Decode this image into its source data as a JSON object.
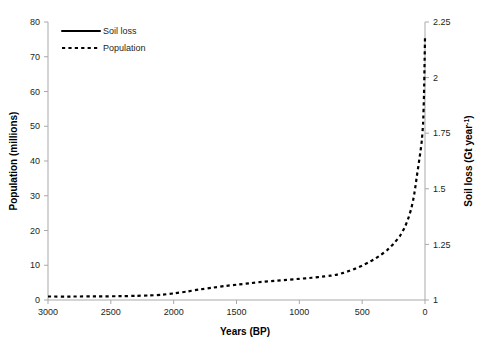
{
  "chart_data": {
    "type": "line",
    "title": "",
    "xlabel": "Years (BP)",
    "ylabel": "Population (millions)",
    "y2label": "Soil loss (Gt year-1)",
    "y2label_base": "Soil loss (Gt year",
    "y2label_sup": "-1",
    "y2label_tail": ")",
    "grid": false,
    "legend_position": "top-left",
    "x_reversed": true,
    "xlim": [
      0,
      3000
    ],
    "ylim": [
      0,
      80
    ],
    "y2lim": [
      1,
      2.25
    ],
    "xticks": [
      3000,
      2500,
      2000,
      1500,
      1000,
      500,
      0
    ],
    "xtick_labels": [
      "3000",
      "2500",
      "2000",
      "1500",
      "1000",
      "500",
      "0"
    ],
    "yticks": [
      0,
      10,
      20,
      30,
      40,
      50,
      60,
      70,
      80
    ],
    "ytick_labels": [
      "0",
      "10",
      "20",
      "30",
      "40",
      "50",
      "60",
      "70",
      "80"
    ],
    "y2ticks": [
      1,
      1.25,
      1.5,
      1.75,
      2,
      2.25
    ],
    "y2tick_labels": [
      "1",
      "1.25",
      "1.5",
      "1.75",
      "2",
      "2.25"
    ],
    "series": [
      {
        "name": "Soil loss",
        "style": "solid",
        "axis": "right",
        "x": [
          3000,
          2800,
          2600,
          2400,
          2300,
          2200,
          2150,
          2100,
          2000,
          1900,
          1800,
          1700,
          1600,
          1500,
          1400,
          1300,
          1200,
          1100,
          1000,
          900,
          800,
          750,
          700,
          650,
          600,
          550,
          500,
          450,
          400,
          350,
          300,
          250,
          200,
          160,
          130,
          110,
          95,
          85,
          75,
          65,
          55,
          45,
          35,
          25,
          15,
          8,
          3,
          0
        ],
        "values": [
          6.4,
          6.4,
          6.45,
          6.5,
          6.6,
          6.8,
          7.0,
          7.4,
          8.4,
          9.3,
          10.0,
          10.5,
          10.8,
          11.1,
          11.3,
          11.5,
          11.7,
          11.9,
          12.1,
          12.3,
          12.6,
          12.8,
          13.0,
          13.6,
          14.3,
          15.1,
          16.0,
          17.0,
          18.1,
          19.4,
          21.0,
          23.0,
          25.6,
          28.5,
          31.5,
          34.0,
          36.5,
          38.5,
          41.0,
          43.5,
          45.5,
          46.8,
          47.3,
          47.4,
          50.0,
          58.0,
          69.0,
          77.0
        ]
      },
      {
        "name": "Population",
        "style": "dashed",
        "axis": "left",
        "x": [
          3000,
          2800,
          2600,
          2400,
          2300,
          2200,
          2100,
          2000,
          1900,
          1800,
          1700,
          1600,
          1500,
          1400,
          1300,
          1200,
          1100,
          1000,
          900,
          800,
          750,
          700,
          650,
          600,
          550,
          500,
          450,
          400,
          350,
          300,
          250,
          200,
          160,
          130,
          110,
          95,
          85,
          75,
          65,
          55,
          45,
          35,
          25,
          15,
          8,
          3,
          0
        ],
        "values": [
          1.0,
          1.0,
          1.05,
          1.1,
          1.2,
          1.3,
          1.5,
          1.9,
          2.4,
          3.0,
          3.5,
          4.0,
          4.4,
          4.8,
          5.2,
          5.5,
          5.8,
          6.1,
          6.4,
          6.8,
          7.0,
          7.3,
          7.8,
          8.4,
          9.1,
          9.9,
          10.8,
          11.8,
          13.0,
          14.4,
          16.2,
          18.4,
          21.0,
          23.8,
          26.2,
          28.6,
          30.6,
          33.0,
          35.6,
          38.0,
          40.5,
          43.0,
          46.0,
          51.0,
          59.0,
          69.0,
          75.5
        ]
      }
    ]
  },
  "legend": {
    "items": [
      {
        "label": "Soil loss",
        "style": "solid"
      },
      {
        "label": "Population",
        "style": "dashed"
      }
    ]
  }
}
